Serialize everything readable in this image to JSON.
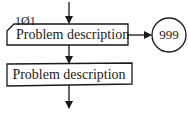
{
  "diagram": {
    "type": "flowchart",
    "step_label": "1Ø1",
    "boxes": [
      {
        "id": "box1",
        "text": "Problem description",
        "shape": "clipped-corner-rectangle"
      },
      {
        "id": "box2",
        "text": "Problem description",
        "shape": "rectangle"
      }
    ],
    "connector": {
      "id": "off-page",
      "text": "999",
      "shape": "circle"
    },
    "edges": [
      {
        "from": "top",
        "to": "box1",
        "direction": "down"
      },
      {
        "from": "box1",
        "to": "connector",
        "direction": "right"
      },
      {
        "from": "box1",
        "to": "box2",
        "direction": "down"
      },
      {
        "from": "box2",
        "to": "bottom",
        "direction": "down"
      }
    ],
    "colors": {
      "stroke": "#1a1a1a",
      "background": "#ffffff"
    }
  }
}
